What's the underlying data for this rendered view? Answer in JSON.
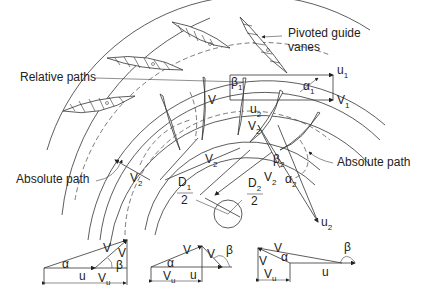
{
  "diagram": {
    "labels": {
      "guide_vanes": [
        "Pivoted guide",
        "vanes"
      ],
      "relative_paths": "Relative paths",
      "absolute_path_right": "Absolute path",
      "absolute_path_left": "Absolute path"
    },
    "symbols": {
      "u1": "u",
      "u1_sub": "1",
      "V1": "V",
      "V1_sub": "1",
      "alpha1": "α",
      "alpha1_sub": "1",
      "beta1": "β",
      "beta1_sub": "1",
      "Vr1": "V",
      "u2": "u",
      "u2_sub": "2",
      "V2_top": "V",
      "V2_top_sub": "2",
      "V2_left": "V",
      "V2_left_sub": "2",
      "V2_mid": "V",
      "V2_mid_sub": "2",
      "beta2": "β",
      "beta2_sub": "2",
      "alpha2": "α",
      "alpha2_sub": "2",
      "V2_right": "V",
      "V2_right_sub": "2",
      "u2_bottom": "u",
      "u2_bottom_sub": "2",
      "D1_num": "D",
      "D1_sub": "1",
      "D1_den": "2",
      "D2_num": "D",
      "D2_sub": "2",
      "D2_den": "2"
    },
    "velocity_triangles": [
      {
        "case": "beta < 90°",
        "labels": {
          "V": "V",
          "Vr": "V",
          "alpha": "α",
          "beta": "β",
          "u": "u",
          "Vu": "V",
          "Vu_sub": "u"
        }
      },
      {
        "case": "beta > 90°",
        "labels": {
          "V": "V",
          "Vr": "V",
          "alpha": "α",
          "beta": "β",
          "u": "u",
          "Vu": "V",
          "Vu_sub": "u"
        }
      },
      {
        "case": "beta ≫ 90°",
        "labels": {
          "V": "V",
          "Vr": "V",
          "alpha": "α",
          "beta": "β",
          "u": "u",
          "Vu": "V",
          "Vu_sub": "u"
        }
      }
    ],
    "colors": {
      "line": "#333333",
      "background": "#ffffff"
    }
  }
}
